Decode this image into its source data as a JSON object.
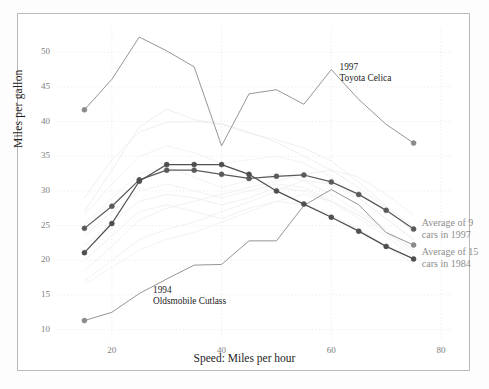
{
  "chart_data": {
    "type": "line",
    "title": "",
    "xlabel": "Speed: Miles per hour",
    "ylabel": "Miles per gallon",
    "xlim": [
      10,
      82
    ],
    "ylim": [
      8.5,
      53.5
    ],
    "xticks": [
      20,
      40,
      60,
      80
    ],
    "yticks": [
      10,
      15,
      20,
      25,
      30,
      35,
      40,
      45,
      50
    ],
    "grid": true,
    "legend_position": "inline-annotations",
    "x": [
      15,
      20,
      25,
      30,
      35,
      40,
      45,
      50,
      55,
      60,
      65,
      70,
      75
    ],
    "series": [
      {
        "name": "1997 Toyota Celica",
        "color": "#8a8a8a",
        "style": "highlight-light",
        "markers": "ends",
        "x": [
          15,
          20,
          25,
          30,
          35,
          40,
          45,
          50,
          55,
          60,
          65,
          70,
          75
        ],
        "values": [
          41.7,
          46.1,
          52.2,
          50.2,
          47.9,
          36.5,
          44.0,
          44.6,
          42.5,
          47.5,
          43.2,
          39.6,
          36.9
        ]
      },
      {
        "name": "1994 Oldsmobile Cutlass",
        "color": "#8a8a8a",
        "style": "highlight-light",
        "markers": "ends",
        "x": [
          15,
          20,
          25,
          30,
          35,
          40,
          45,
          50,
          55,
          60,
          65,
          70,
          75
        ],
        "values": [
          11.3,
          12.5,
          15.2,
          17.3,
          19.3,
          19.4,
          22.8,
          22.8,
          27.9,
          30.2,
          28.0,
          24.0,
          22.2
        ]
      },
      {
        "name": "Average of 9 cars in 1997",
        "color": "#5a5a5a",
        "style": "bold-marked",
        "markers": "all",
        "x": [
          15,
          20,
          25,
          30,
          35,
          40,
          45,
          50,
          55,
          60,
          65,
          70,
          75
        ],
        "values": [
          24.6,
          27.8,
          31.6,
          33.0,
          33.0,
          32.4,
          31.8,
          32.1,
          32.3,
          31.3,
          29.5,
          27.2,
          24.5
        ]
      },
      {
        "name": "Average of 15 cars in 1984",
        "color": "#4f4f4f",
        "style": "bold-marked",
        "markers": "all",
        "x": [
          15,
          20,
          25,
          30,
          35,
          40,
          45,
          50,
          55,
          60,
          65,
          70,
          75
        ],
        "values": [
          21.1,
          25.3,
          31.4,
          33.8,
          33.8,
          33.8,
          32.4,
          30.0,
          28.1,
          26.2,
          24.2,
          22.0,
          20.2
        ]
      },
      {
        "name": "background-car-1",
        "color": "#ebebeb",
        "style": "faint",
        "markers": "none",
        "x": [
          15,
          20,
          25,
          30,
          35,
          40,
          45,
          50,
          55,
          60,
          65,
          70,
          75
        ],
        "values": [
          29.0,
          34.5,
          38.5,
          39.9,
          40.0,
          39.7,
          38.5,
          37.0,
          35.0,
          33.0,
          30.5,
          27.5,
          24.0
        ]
      },
      {
        "name": "background-car-2",
        "color": "#ebebeb",
        "style": "faint",
        "markers": "none",
        "x": [
          15,
          20,
          25,
          30,
          35,
          40,
          45,
          50,
          55,
          60,
          65,
          70,
          75
        ],
        "values": [
          27.0,
          33.0,
          39.2,
          41.8,
          40.3,
          39.6,
          38.3,
          37.4,
          36.2,
          34.3,
          31.3,
          27.8,
          24.8
        ]
      },
      {
        "name": "background-car-3",
        "color": "#ededed",
        "style": "faint",
        "markers": "none",
        "x": [
          15,
          20,
          25,
          30,
          35,
          40,
          45,
          50,
          55,
          60,
          65,
          70,
          75
        ],
        "values": [
          18.5,
          22.0,
          25.8,
          27.5,
          28.5,
          29.5,
          30.5,
          31.4,
          32.4,
          33.0,
          32.0,
          29.5,
          26.5
        ]
      },
      {
        "name": "background-car-4",
        "color": "#ededed",
        "style": "faint",
        "markers": "none",
        "x": [
          15,
          20,
          25,
          30,
          35,
          40,
          45,
          50,
          55,
          60,
          65,
          70,
          75
        ],
        "values": [
          17.0,
          20.0,
          23.0,
          24.5,
          25.5,
          27.0,
          28.4,
          30.0,
          31.5,
          31.0,
          29.0,
          26.0,
          23.0
        ]
      },
      {
        "name": "background-car-5",
        "color": "#eeeeee",
        "style": "faint",
        "markers": "none",
        "x": [
          15,
          20,
          25,
          30,
          35,
          40,
          45,
          50,
          55,
          60,
          65,
          70,
          75
        ],
        "values": [
          22.0,
          25.5,
          28.5,
          29.5,
          29.0,
          28.0,
          29.0,
          30.5,
          30.0,
          28.5,
          26.5,
          24.0,
          21.0
        ]
      },
      {
        "name": "background-car-6",
        "color": "#eeeeee",
        "style": "faint",
        "markers": "none",
        "x": [
          15,
          20,
          25,
          30,
          35,
          40,
          45,
          50,
          55,
          60,
          65,
          70,
          75
        ],
        "values": [
          20.0,
          23.5,
          27.0,
          28.0,
          27.0,
          26.0,
          27.5,
          28.5,
          28.0,
          26.5,
          24.5,
          22.0,
          19.5
        ]
      },
      {
        "name": "background-car-7",
        "color": "#efefef",
        "style": "faint",
        "markers": "none",
        "x": [
          15,
          20,
          25,
          30,
          35,
          40,
          45,
          50,
          55,
          60,
          65,
          70,
          75
        ],
        "values": [
          25.0,
          29.0,
          32.5,
          33.5,
          32.0,
          30.5,
          31.5,
          32.5,
          31.5,
          29.5,
          27.0,
          24.5,
          21.5
        ]
      },
      {
        "name": "background-car-8",
        "color": "#efefef",
        "style": "faint",
        "markers": "none",
        "x": [
          15,
          20,
          25,
          30,
          35,
          40,
          45,
          50,
          55,
          60,
          65,
          70,
          75
        ],
        "values": [
          23.5,
          27.0,
          30.0,
          31.0,
          30.0,
          29.0,
          30.0,
          31.0,
          30.5,
          28.5,
          26.0,
          23.5,
          20.5
        ]
      },
      {
        "name": "background-car-9",
        "color": "#f0f0f0",
        "style": "faint",
        "markers": "none",
        "x": [
          15,
          20,
          25,
          30,
          35,
          40,
          45,
          50,
          55,
          60,
          65,
          70,
          75
        ],
        "values": [
          26.5,
          31.0,
          35.0,
          36.5,
          35.5,
          34.0,
          34.5,
          35.0,
          34.0,
          32.0,
          29.0,
          26.0,
          23.0
        ]
      },
      {
        "name": "background-car-10",
        "color": "#f0f0f0",
        "style": "faint",
        "markers": "none",
        "x": [
          15,
          20,
          25,
          30,
          35,
          40,
          45,
          50,
          55,
          60,
          65,
          70,
          75
        ],
        "values": [
          16.5,
          19.0,
          21.5,
          23.0,
          24.0,
          25.5,
          27.0,
          28.5,
          29.5,
          28.5,
          26.5,
          24.0,
          21.5
        ]
      }
    ],
    "annotations": [
      {
        "id": "celica",
        "line1": "1997",
        "line2": "Toyota Celica",
        "x": 61.5,
        "y": 47.8
      },
      {
        "id": "cutlass",
        "line1": "1994",
        "line2": "Oldsmobile Cutlass",
        "x": 27.5,
        "y": 15.6
      }
    ],
    "inline_legends": [
      {
        "id": "avg9",
        "line1": "Average of 9",
        "line2": "cars in 1997",
        "x": 76.5,
        "y": 25.2
      },
      {
        "id": "avg15",
        "line1": "Average of 15",
        "line2": "cars in 1984",
        "x": 76.5,
        "y": 21.0
      }
    ]
  }
}
